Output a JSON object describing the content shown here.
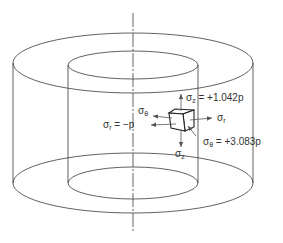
{
  "diagram": {
    "labels": {
      "sigma_z_top": {
        "symbol": "σ",
        "sub": "z",
        "rest": " = +1.042p"
      },
      "sigma_theta_left": {
        "symbol": "σ",
        "sub": "θ",
        "rest": ""
      },
      "sigma_r_left": {
        "symbol": "σ",
        "sub": "r",
        "rest": " = −p"
      },
      "sigma_r_right": {
        "symbol": "σ",
        "sub": "r",
        "rest": ""
      },
      "sigma_theta_right": {
        "symbol": "σ",
        "sub": "θ",
        "rest": " = +3.083p"
      },
      "sigma_z_bottom": {
        "symbol": "σ",
        "sub": "z",
        "rest": ""
      }
    },
    "colors": {
      "line": "#3a3a3a",
      "arrow": "#555555",
      "text": "#333333"
    }
  }
}
